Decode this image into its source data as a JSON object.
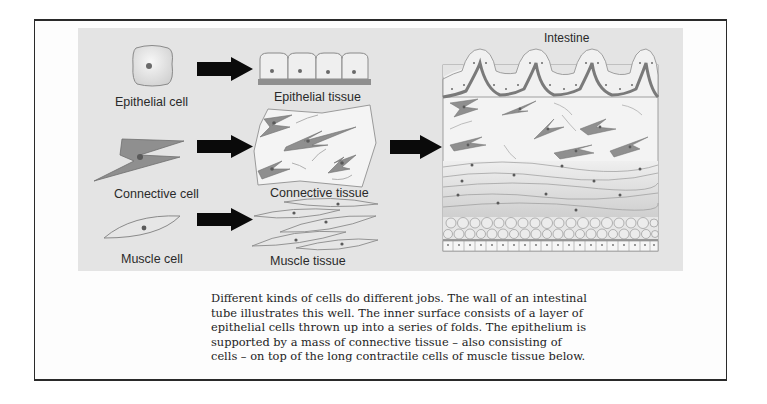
{
  "figure": {
    "title": "Intestine",
    "rows": [
      {
        "cell_label": "Epithelial cell",
        "tissue_label": "Epithelial tissue"
      },
      {
        "cell_label": "Connective cell",
        "tissue_label": "Connective tissue"
      },
      {
        "cell_label": "Muscle cell",
        "tissue_label": "Muscle tissue"
      }
    ],
    "icons": {
      "row_arrow": "right-arrow-icon",
      "big_arrow": "right-arrow-icon"
    },
    "colors": {
      "panel_background": "#e4e4e4",
      "cell_fill": "#efefef",
      "connective_cell_fill": "#8f8f8f",
      "nucleus": "#6a6a6a",
      "basement_membrane": "#8c8c8c",
      "arrow": "#0a0a0a",
      "frame_border": "#2a2a2a"
    }
  },
  "caption": {
    "lines": [
      "Different kinds of cells do different jobs. The wall of an intestinal",
      "tube illustrates this well. The inner surface consists of a layer of",
      "epithelial cells thrown up into a series of folds. The epithelium is",
      "supported by a mass of connective tissue – also consisting of",
      "cells – on top of the long contractile cells of muscle tissue below."
    ]
  }
}
